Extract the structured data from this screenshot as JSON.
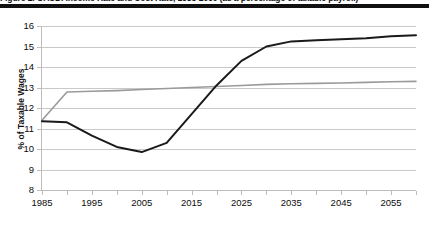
{
  "caption": {
    "text": "Figure 2. OASDI Income Rate and Cost Rate, 1985-2060 (as a percentage of taxable payroll)"
  },
  "axes": {
    "ylabel": "% of Taxable Wages",
    "yticks": [
      16,
      15,
      14,
      13,
      12,
      11,
      10,
      9,
      8
    ],
    "xticks_labeled": [
      1985,
      1995,
      2005,
      2015,
      2025,
      2035,
      2045,
      2055
    ],
    "xticks_minor": [
      1990,
      2000,
      2010,
      2020,
      2030,
      2040,
      2050,
      2060
    ]
  },
  "colors": {
    "cost_rate": "#1a1a1a",
    "income_rate": "#9a9a9a",
    "gridline": "#c9c9c9",
    "axis": "#bdbdbd",
    "rule": "#111111"
  },
  "chart_data": {
    "type": "line",
    "title": "",
    "xlabel": "",
    "ylabel": "% of Taxable Wages",
    "xlim": [
      1985,
      2060
    ],
    "ylim": [
      8,
      16
    ],
    "grid": true,
    "legend": "none",
    "x": [
      1985,
      1990,
      1995,
      2000,
      2005,
      2010,
      2015,
      2020,
      2025,
      2030,
      2035,
      2040,
      2045,
      2050,
      2055,
      2060
    ],
    "series": [
      {
        "name": "Cost Rate",
        "color": "#1a1a1a",
        "values": [
          11.35,
          11.3,
          10.65,
          10.1,
          9.85,
          10.3,
          11.7,
          13.1,
          14.3,
          15.0,
          15.25,
          15.3,
          15.35,
          15.4,
          15.5,
          15.55
        ]
      },
      {
        "name": "Income Rate",
        "color": "#9a9a9a",
        "values": [
          11.4,
          12.78,
          12.82,
          12.85,
          12.9,
          12.95,
          13.0,
          13.05,
          13.1,
          13.15,
          13.18,
          13.2,
          13.22,
          13.25,
          13.28,
          13.3
        ]
      }
    ]
  }
}
